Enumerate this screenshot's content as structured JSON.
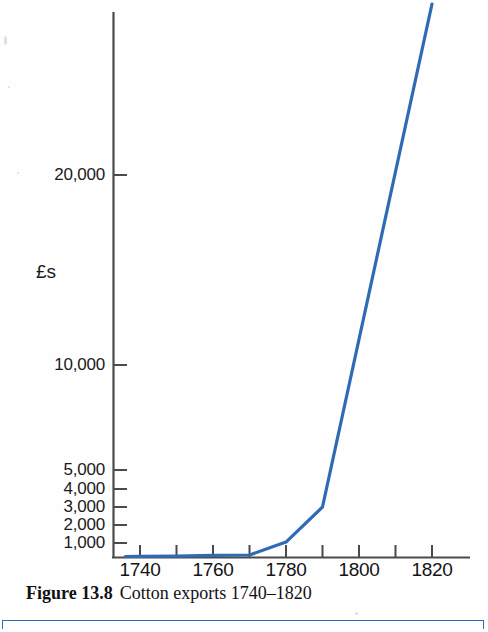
{
  "figure": {
    "caption_label": "Figure 13.8",
    "caption_text": "Cotton exports 1740–1820"
  },
  "colors": {
    "line": "#2f6ab5",
    "axis": "#4a4a4a",
    "text": "#111111",
    "rule": "#2f6ab5"
  },
  "chart_data": {
    "type": "line",
    "title": "Cotton exports 1740–1820",
    "xlabel": "",
    "ylabel": "£s",
    "xlim": [
      1735,
      1822
    ],
    "ylim": [
      0,
      30000
    ],
    "grid": false,
    "legend": "none",
    "y_scale_note": "compressed / logarithmic-style scale",
    "x_ticks": [
      1740,
      1750,
      1760,
      1770,
      1780,
      1790,
      1800,
      1810,
      1820
    ],
    "x_tick_labels": [
      "1740",
      "",
      "1760",
      "",
      "1780",
      "",
      "1800",
      "",
      "1820"
    ],
    "y_ticks": [
      1000,
      2000,
      3000,
      4000,
      5000,
      10000,
      20000
    ],
    "y_tick_labels": [
      "1,000",
      "2,000",
      "3,000",
      "4,000",
      "5,000",
      "10,000",
      "20,000"
    ],
    "series": [
      {
        "name": "Cotton exports",
        "x": [
          1736,
          1740,
          1750,
          1760,
          1770,
          1780,
          1790,
          1820
        ],
        "values": [
          120,
          140,
          200,
          400,
          480,
          1050,
          3000,
          29000
        ]
      }
    ]
  },
  "axis": {
    "y_title": "£s",
    "y_labels": [
      {
        "text": "20,000",
        "value": 20000,
        "y": 175
      },
      {
        "text": "10,000",
        "value": 10000,
        "y": 365
      },
      {
        "text": "5,000",
        "value": 5000,
        "y": 470
      },
      {
        "text": "4,000",
        "value": 4000,
        "y": 489
      },
      {
        "text": "3,000",
        "value": 3000,
        "y": 507
      },
      {
        "text": "2,000",
        "value": 2000,
        "y": 525
      },
      {
        "text": "1,000",
        "value": 1000,
        "y": 543
      }
    ],
    "x_labels": [
      {
        "text": "1740",
        "value": 1740,
        "x": 140
      },
      {
        "text": "1760",
        "value": 1760,
        "x": 213
      },
      {
        "text": "1780",
        "value": 1780,
        "x": 286
      },
      {
        "text": "1800",
        "value": 1800,
        "x": 359
      },
      {
        "text": "1820",
        "value": 1820,
        "x": 432
      }
    ]
  }
}
